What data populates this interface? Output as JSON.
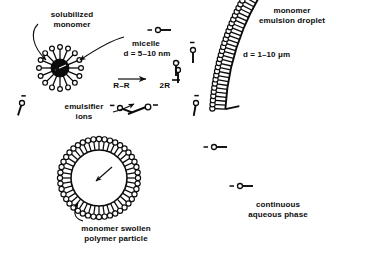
{
  "figure": {
    "title_absent": true,
    "background_color": "#ffffff",
    "ink_color": "#0b0b0b"
  },
  "labels": {
    "solubilized_monomer": "solubilized\nmonomer",
    "micelle": "micelle",
    "micelle_diameter": "d = 5–10 nm",
    "reaction": "R–R        2R",
    "reaction_reactant": "R–R",
    "reaction_product": "2R",
    "emulsifier_ions": "emulsifier\nions",
    "monomer_emulsion_droplet": "monomer\nemulsion droplet",
    "droplet_diameter": "d = 1–10 μm",
    "continuous_aqueous_phase": "continuous\naqueous phase",
    "monomer_swollen_polymer_particle": "monomer swollen\npolymer particle"
  },
  "objects": {
    "micelle": {
      "name": "micelle",
      "center_x": 60,
      "center_y": 68,
      "core_radius": 9,
      "tail_length": 14,
      "head_radius": 2.4,
      "surfactant_count": 16,
      "core_fill": "#0b0b0b",
      "diameter_text": "d = 5–10 nm"
    },
    "polymer_particle": {
      "name": "monomer-swollen-polymer-particle",
      "center_x": 99,
      "center_y": 178,
      "core_radius": 28,
      "tail_length": 14,
      "head_radius": 2.6,
      "surfactant_count": 44,
      "core_fill": "#ffffff",
      "inner_arrow": true
    },
    "emulsion_droplet": {
      "name": "monomer-emulsion-droplet",
      "arc_center_x": 470,
      "arc_center_y": 122,
      "arc_radius": 245,
      "arc_start_deg": 183,
      "arc_end_deg": 222,
      "tail_length": 13,
      "head_radius": 2.6,
      "surfactant_count": 42,
      "diameter_text": "d = 1–10 μm"
    }
  },
  "free_emulsifier_ions": [
    {
      "id": "ion-top-right",
      "x": 158,
      "y": 30,
      "angle_deg": 0,
      "charge": "−"
    },
    {
      "id": "ion-mid-right",
      "x": 193,
      "y": 50,
      "angle_deg": 90,
      "charge": "−"
    },
    {
      "id": "ion-left",
      "x": 22,
      "y": 103,
      "angle_deg": 108,
      "charge": "−"
    },
    {
      "id": "ion-radical",
      "x": 178,
      "y": 70,
      "angle_deg": 90,
      "charge": "−"
    },
    {
      "id": "ion-center-right",
      "x": 196,
      "y": 103,
      "angle_deg": 100,
      "charge": "−"
    },
    {
      "id": "ion-label-sample",
      "x": 120,
      "y": 108,
      "angle_deg": 20,
      "charge": "−"
    },
    {
      "id": "ion-lower-1",
      "x": 214,
      "y": 147,
      "angle_deg": 0,
      "charge": "−"
    },
    {
      "id": "ion-lower-2",
      "x": 240,
      "y": 186,
      "angle_deg": 0,
      "charge": "−"
    }
  ],
  "leader_lines": [
    {
      "id": "leader-solubilized-monomer",
      "from": "solubilized-monomer-label",
      "to": "micelle-core"
    },
    {
      "id": "leader-micelle",
      "from": "micelle-label",
      "to": "micelle-shell"
    },
    {
      "id": "leader-polymer-particle",
      "from": "polymer-particle-label",
      "to": "particle-shell"
    }
  ]
}
